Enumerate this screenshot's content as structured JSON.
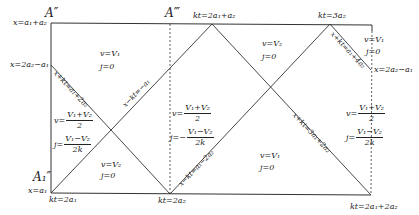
{
  "diagram": {
    "corner_labels": {
      "top_left": "A″",
      "top_mid": "A‴",
      "bottom_left": "A₁″"
    },
    "left_axis_labels": {
      "top": "x=a₁+a₂",
      "mid": "x=2a₂−a₁",
      "bottom": "x=a₁"
    },
    "right_axis_label": "x=2a₂−a₁",
    "top_axis_labels": {
      "vertex1": "kt=2a₁+a₂",
      "vertex2": "kt=3a₂"
    },
    "bottom_axis_labels": {
      "left": "kt=2a₁",
      "mid": "kt=2a₂",
      "right": "kt=2a₁+2a₂"
    },
    "line_labels": {
      "left_diag": "x+kt=a₁+2a₂",
      "rise1": "x−kt=−a₁",
      "rise2": "x−kt=a₁−2a₂",
      "fall_right": "x+kt=3a₁+2a₂",
      "top_right_diag": "x+kt=a₁+4a₂"
    },
    "regions": {
      "top_left": {
        "v": "v=V₁",
        "j": "j=0"
      },
      "top_mid": {
        "v": "v=V₂",
        "j": "j=0"
      },
      "top_right": {
        "v": "v=V₁",
        "j": "j=0"
      },
      "left_mid": {
        "v_lhs": "v=",
        "v_num": "V₁+V₂",
        "v_den": "2",
        "j_lhs": "j=",
        "j_num": "V₁−V₂",
        "j_den": "2k"
      },
      "center": {
        "v_lhs": "v=",
        "v_num": "V₁+V₂",
        "v_den": "2",
        "j_lhs": "j=−",
        "j_num": "V₁−V₂",
        "j_den": "2k"
      },
      "right_mid": {
        "v_lhs": "v=",
        "v_num": "V₁+V₂",
        "v_den": "2",
        "j_lhs": "j=",
        "j_num": "V₁−V₂",
        "j_den": "2k"
      },
      "bottom_left": {
        "v": "v=V₂",
        "j": "j=0"
      },
      "bottom_right": {
        "v": "v=V₁",
        "j": "j=0"
      }
    },
    "line_color": "#333333"
  }
}
